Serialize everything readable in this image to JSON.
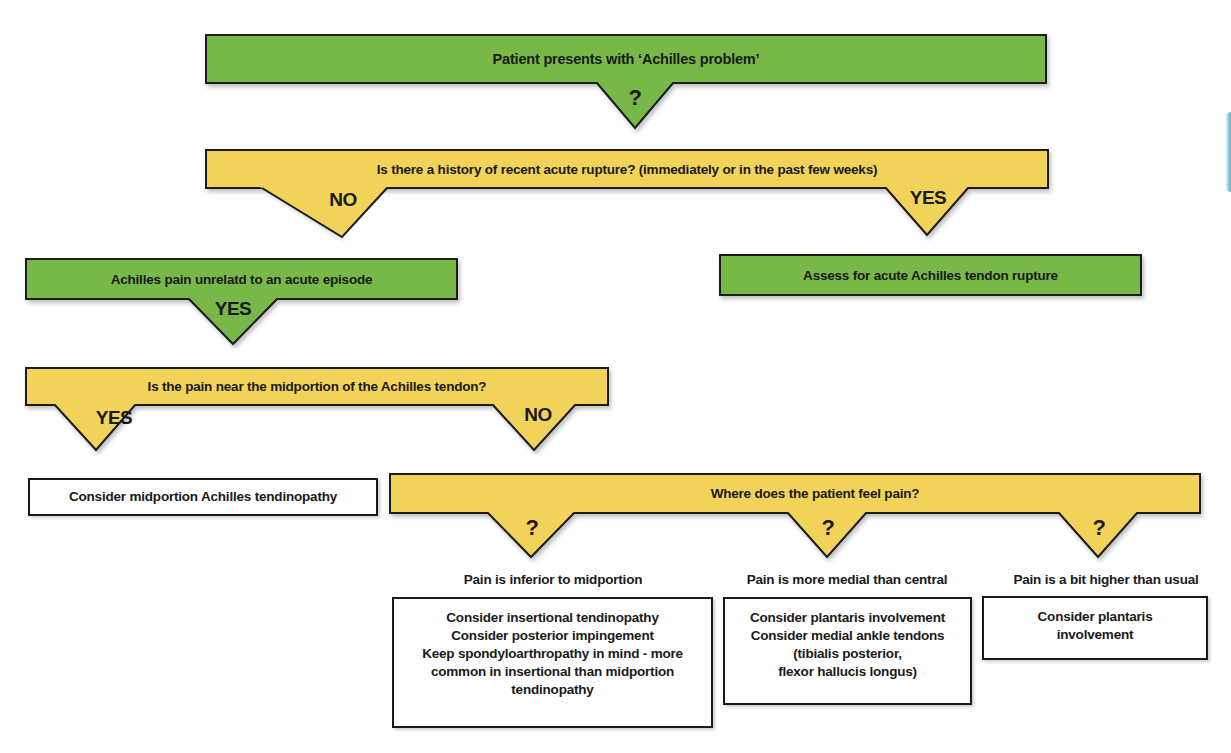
{
  "colors": {
    "decision_green": "#78b84a",
    "question_yellow": "#f1d35a",
    "outline": "#1a1a1a",
    "result_box_bg": "#ffffff"
  },
  "nodes": {
    "start": {
      "text": "Patient presents with ‘Achilles problem’",
      "pointer_label": "?"
    },
    "rupture_question": {
      "text": "Is there a history of recent acute rupture? (immediately or in the past few weeks)",
      "no_label": "NO",
      "yes_label": "YES"
    },
    "unrelated_pain": {
      "text": "Achilles pain unrelatd to an acute episode",
      "yes_label": "YES"
    },
    "assess_rupture": {
      "text": "Assess for acute Achilles tendon rupture"
    },
    "midportion_question": {
      "text": "Is the pain near the midportion of the Achilles tendon?",
      "yes_label": "YES",
      "no_label": "NO"
    },
    "midportion_result": {
      "text": "Consider midportion Achilles tendinopathy"
    },
    "location_question": {
      "text": "Where does the patient feel pain?",
      "pointer_labels": [
        "?",
        "?",
        "?"
      ]
    }
  },
  "outcomes": [
    {
      "heading": "Pain is inferior to midportion",
      "lines": [
        "Consider insertional tendinopathy",
        "Consider posterior impingement",
        "Keep spondyloarthropathy in mind - more",
        "common in insertional than midportion",
        "tendinopathy"
      ]
    },
    {
      "heading": "Pain is more medial than central",
      "lines": [
        "Consider plantaris involvement",
        "Consider medial ankle tendons",
        "(tibialis posterior,",
        "flexor hallucis longus)"
      ]
    },
    {
      "heading": "Pain is a bit higher than usual",
      "lines": [
        "Consider plantaris",
        "involvement"
      ]
    }
  ]
}
